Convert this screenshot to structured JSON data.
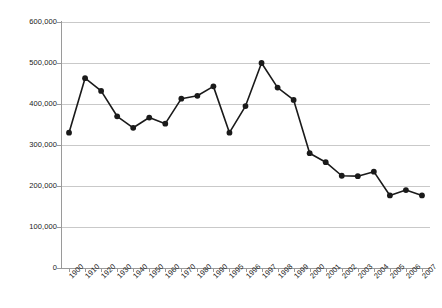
{
  "chart_data": {
    "type": "line",
    "title": "",
    "xlabel": "",
    "ylabel": "",
    "categories": [
      "1900",
      "1910",
      "1920",
      "1930",
      "1940",
      "1950",
      "1960",
      "1970",
      "1980",
      "1990",
      "1995",
      "1996",
      "1997",
      "1998",
      "1999",
      "2000",
      "2001",
      "2002",
      "2003",
      "2004",
      "2005",
      "2006",
      "2007"
    ],
    "values": [
      330000,
      463000,
      432000,
      370000,
      342000,
      367000,
      352000,
      413000,
      420000,
      443000,
      330000,
      395000,
      500000,
      440000,
      410000,
      280000,
      258000,
      225000,
      224000,
      235000,
      177000,
      190000,
      177000
    ],
    "series": [
      {
        "name": "",
        "values": [
          330000,
          463000,
          432000,
          370000,
          342000,
          367000,
          352000,
          413000,
          420000,
          443000,
          330000,
          395000,
          500000,
          440000,
          410000,
          280000,
          258000,
          225000,
          224000,
          235000,
          177000,
          190000,
          177000
        ]
      }
    ],
    "ylim": [
      0,
      600000
    ],
    "y_ticks": [
      0,
      100000,
      200000,
      300000,
      400000,
      500000,
      600000
    ],
    "y_tick_labels": [
      "0",
      "100,000",
      "200,000",
      "300,000",
      "400,000",
      "500,000",
      "600,000"
    ],
    "grid": true,
    "legend": false,
    "legend_position": "none",
    "line_color": "#1a1a1a",
    "marker_color": "#1a1a1a",
    "grid_color": "#c9c9c9",
    "background_color": "#ffffff"
  }
}
